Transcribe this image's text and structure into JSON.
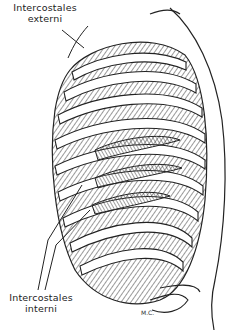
{
  "diagram": {
    "labels": {
      "externi": {
        "line1": "Intercostales",
        "line2": "externi"
      },
      "interni": {
        "line1": "Intercostales",
        "line2": "interni"
      }
    },
    "signature": "M.C.",
    "colors": {
      "ink": "#222222",
      "background": "#ffffff",
      "shade": "#888888"
    }
  }
}
